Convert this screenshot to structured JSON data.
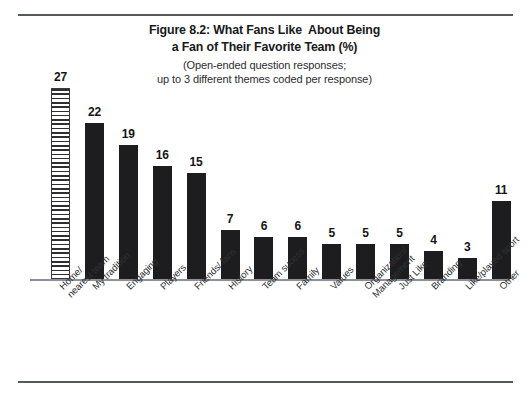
{
  "figure": {
    "title_line1": "Figure 8.2: What Fans Like  About Being",
    "title_line2": "a Fan of Their Favorite Team (%)",
    "subtitle_line1": "(Open-ended question responses;",
    "subtitle_line2": "up to 3 different themes coded per response)"
  },
  "chart_data": {
    "type": "bar",
    "title": "Figure 8.2: What Fans Like  About Being a Fan of Their Favorite Team (%)",
    "subtitle": "(Open-ended question responses; up to 3 different themes coded per response)",
    "xlabel": "",
    "ylabel": "",
    "ylim": [
      0,
      30
    ],
    "grid": false,
    "legend": "none",
    "axis_visible": {
      "x": true,
      "y": false
    },
    "categories": [
      "Home/ nearest team",
      "My tradition",
      "Engaging",
      "Players",
      "Friends/ fans",
      "History",
      "Team sucess",
      "Family",
      "Values",
      "Organization/ Management",
      "Just Like",
      "Branding",
      "Like/played sport",
      "Other"
    ],
    "category_lines": [
      [
        "Home/",
        "nearest team"
      ],
      [
        "My tradition",
        ""
      ],
      [
        "Engaging",
        ""
      ],
      [
        "Players",
        ""
      ],
      [
        "Friends/ fans",
        ""
      ],
      [
        "History",
        ""
      ],
      [
        "Team sucess",
        ""
      ],
      [
        "Family",
        ""
      ],
      [
        "Values",
        ""
      ],
      [
        "Organization/",
        "Management"
      ],
      [
        "Just Like",
        ""
      ],
      [
        "Branding",
        ""
      ],
      [
        "Like/played sport",
        ""
      ],
      [
        "Other",
        ""
      ]
    ],
    "values": [
      27,
      22,
      19,
      16,
      15,
      7,
      6,
      6,
      5,
      5,
      5,
      4,
      3,
      11
    ],
    "value_labels": [
      "27",
      "22",
      "19",
      "16",
      "15",
      "7",
      "6",
      "6",
      "5",
      "5",
      "5",
      "4",
      "3",
      "11"
    ],
    "bar_styles": [
      "hatched-horizontal",
      "solid",
      "solid",
      "solid",
      "solid",
      "solid",
      "solid",
      "solid",
      "solid",
      "solid",
      "solid",
      "solid",
      "solid",
      "solid"
    ],
    "colors": {
      "bar_fill": "#1d1d1f",
      "hatch_line": "#2f2f31",
      "hatch_background": "#ffffff",
      "axis": "#8d9195",
      "rule": "#55595c",
      "text": "#2e3033",
      "title_text": "#18191b",
      "page_background": "#ffffff"
    }
  }
}
